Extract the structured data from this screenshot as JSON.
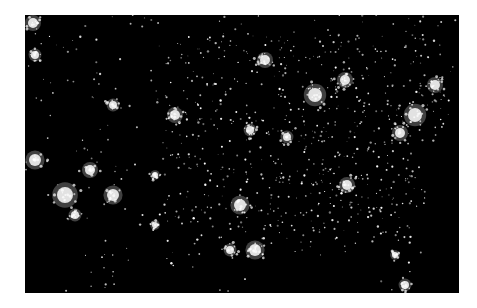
{
  "image": {
    "subject": "Continental United States at night from space, city lights",
    "background_color": "#000000",
    "light_color": "#ffffff",
    "frame": {
      "x": 25,
      "y": 15,
      "width": 434,
      "height": 278
    },
    "bright_cities": [
      {
        "name": "Seattle",
        "x": 8,
        "y": 8,
        "r": 5
      },
      {
        "name": "Portland",
        "x": 10,
        "y": 40,
        "r": 4
      },
      {
        "name": "San Francisco Bay",
        "x": 10,
        "y": 145,
        "r": 6
      },
      {
        "name": "Los Angeles",
        "x": 40,
        "y": 180,
        "r": 8
      },
      {
        "name": "San Diego",
        "x": 50,
        "y": 200,
        "r": 4
      },
      {
        "name": "Las Vegas",
        "x": 65,
        "y": 155,
        "r": 5
      },
      {
        "name": "Phoenix",
        "x": 88,
        "y": 180,
        "r": 6
      },
      {
        "name": "Salt Lake City",
        "x": 88,
        "y": 90,
        "r": 4
      },
      {
        "name": "Denver",
        "x": 150,
        "y": 100,
        "r": 5
      },
      {
        "name": "Albuquerque",
        "x": 130,
        "y": 160,
        "r": 3
      },
      {
        "name": "El Paso",
        "x": 130,
        "y": 210,
        "r": 3
      },
      {
        "name": "Minneapolis",
        "x": 240,
        "y": 45,
        "r": 5
      },
      {
        "name": "Kansas City",
        "x": 225,
        "y": 115,
        "r": 4
      },
      {
        "name": "Chicago",
        "x": 290,
        "y": 80,
        "r": 7
      },
      {
        "name": "St Louis",
        "x": 262,
        "y": 122,
        "r": 4
      },
      {
        "name": "Detroit",
        "x": 320,
        "y": 65,
        "r": 5
      },
      {
        "name": "Dallas",
        "x": 215,
        "y": 190,
        "r": 6
      },
      {
        "name": "Houston",
        "x": 230,
        "y": 235,
        "r": 6
      },
      {
        "name": "San Antonio",
        "x": 205,
        "y": 235,
        "r": 4
      },
      {
        "name": "Atlanta",
        "x": 322,
        "y": 170,
        "r": 5
      },
      {
        "name": "New York",
        "x": 390,
        "y": 100,
        "r": 7
      },
      {
        "name": "Boston",
        "x": 410,
        "y": 70,
        "r": 5
      },
      {
        "name": "Washington DC",
        "x": 375,
        "y": 118,
        "r": 5
      },
      {
        "name": "Miami",
        "x": 380,
        "y": 270,
        "r": 4
      },
      {
        "name": "Orlando",
        "x": 370,
        "y": 240,
        "r": 3
      }
    ],
    "dense_region": {
      "x_min": 140,
      "x_max": 420,
      "y_min": 20,
      "y_max": 230
    },
    "scatter_count": 900
  }
}
